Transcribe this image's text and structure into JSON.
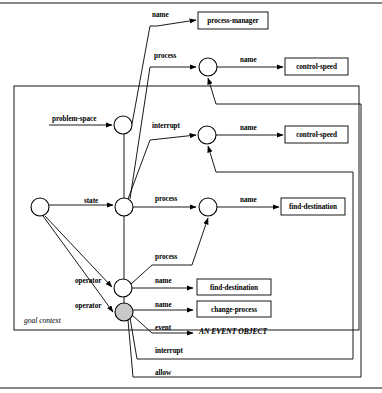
{
  "diagram": {
    "context_box": {
      "label": "goal context",
      "x": 14,
      "y": 86,
      "w": 345,
      "h": 244
    },
    "nodes": [
      {
        "id": "root",
        "name": "root-node",
        "cx": 40,
        "cy": 207,
        "r": 9,
        "shaded": false
      },
      {
        "id": "problem-space",
        "name": "problem-space-node",
        "cx": 123,
        "cy": 125,
        "r": 9,
        "shaded": false
      },
      {
        "id": "state",
        "name": "state-node",
        "cx": 124,
        "cy": 207,
        "r": 9,
        "shaded": false
      },
      {
        "id": "operator-1",
        "name": "operator-node-1",
        "cx": 123,
        "cy": 288,
        "r": 9,
        "shaded": false
      },
      {
        "id": "operator-2",
        "name": "operator-node-2",
        "cx": 124,
        "cy": 312,
        "r": 9,
        "shaded": true
      },
      {
        "id": "process-a",
        "name": "process-node-a",
        "cx": 208,
        "cy": 67,
        "r": 9,
        "shaded": false
      },
      {
        "id": "interrupt-a",
        "name": "interrupt-node-a",
        "cx": 207,
        "cy": 135,
        "r": 9,
        "shaded": false
      },
      {
        "id": "process-b",
        "name": "process-node-b",
        "cx": 208,
        "cy": 207,
        "r": 9,
        "shaded": false
      }
    ],
    "terminals": [
      {
        "id": "t-process-manager",
        "label": "process-manager",
        "x": 198,
        "y": 12,
        "w": 70,
        "h": 17
      },
      {
        "id": "t-control-speed-1",
        "label": "control-speed",
        "x": 285,
        "y": 58,
        "w": 63,
        "h": 17
      },
      {
        "id": "t-control-speed-2",
        "label": "control-speed",
        "x": 285,
        "y": 126,
        "w": 63,
        "h": 17
      },
      {
        "id": "t-find-destination-1",
        "label": "find-destination",
        "x": 281,
        "y": 198,
        "w": 64,
        "h": 17
      },
      {
        "id": "t-find-destination-2",
        "label": "find-destination",
        "x": 197,
        "y": 279,
        "w": 74,
        "h": 16
      },
      {
        "id": "t-change-process",
        "label": "change-process",
        "x": 197,
        "y": 301,
        "w": 74,
        "h": 16
      }
    ],
    "free_terminals": [
      {
        "id": "t-event-object",
        "label": "AN EVENT OBJECT",
        "x": 199,
        "y": 334
      }
    ],
    "edge_labels": [
      {
        "id": "lbl-name-1",
        "text": "name",
        "x": 152,
        "y": 17
      },
      {
        "id": "lbl-process-1",
        "text": "process",
        "x": 154,
        "y": 58
      },
      {
        "id": "lbl-name-2",
        "text": "name",
        "x": 240,
        "y": 62
      },
      {
        "id": "lbl-interrupt-1",
        "text": "interrupt",
        "x": 152,
        "y": 128
      },
      {
        "id": "lbl-name-3",
        "text": "name",
        "x": 240,
        "y": 130
      },
      {
        "id": "lbl-problem-space",
        "text": "problem-space",
        "x": 52,
        "y": 121
      },
      {
        "id": "lbl-state",
        "text": "state",
        "x": 84,
        "y": 203
      },
      {
        "id": "lbl-process-2",
        "text": "process",
        "x": 155,
        "y": 201
      },
      {
        "id": "lbl-name-4",
        "text": "name",
        "x": 240,
        "y": 202
      },
      {
        "id": "lbl-process-3",
        "text": "process",
        "x": 155,
        "y": 259
      },
      {
        "id": "lbl-operator-1",
        "text": "operator",
        "x": 75,
        "y": 283
      },
      {
        "id": "lbl-name-5",
        "text": "name",
        "x": 155,
        "y": 283
      },
      {
        "id": "lbl-operator-2",
        "text": "operator",
        "x": 75,
        "y": 308
      },
      {
        "id": "lbl-name-6",
        "text": "name",
        "x": 155,
        "y": 307
      },
      {
        "id": "lbl-event",
        "text": "event",
        "x": 155,
        "y": 330
      },
      {
        "id": "lbl-interrupt-2",
        "text": "interrupt",
        "x": 155,
        "y": 353
      },
      {
        "id": "lbl-allow",
        "text": "allow",
        "x": 155,
        "y": 375
      }
    ],
    "edges": [
      {
        "id": "e-name-1",
        "name": "edge-problem-space-to-process-manager",
        "d": "M 150 26 L 157 26 L 196 20",
        "arrow": true
      },
      {
        "id": "e-process-1",
        "name": "edge-to-process-node-a",
        "d": "M 150 67 L 196 67",
        "arrow": true
      },
      {
        "id": "e-name-2",
        "name": "edge-process-a-to-control-speed",
        "d": "M 217 67 L 283 67",
        "arrow": true
      },
      {
        "id": "e-interrupt-1",
        "name": "edge-to-interrupt-node-a",
        "d": "M 150 140 L 196 135",
        "arrow": true
      },
      {
        "id": "e-name-3",
        "name": "edge-interrupt-a-to-control-speed",
        "d": "M 216 135 L 283 135",
        "arrow": true
      },
      {
        "id": "e-problem-space",
        "name": "edge-root-to-problem-space",
        "d": "M 49 125 L 112 125",
        "arrow": true
      },
      {
        "id": "e-ps-riser",
        "name": "edge-problem-space-riser",
        "d": "M 132 124 L 150 26",
        "arrow": false
      },
      {
        "id": "e-state",
        "name": "edge-root-to-state",
        "d": "M 49 205 L 113 205",
        "arrow": true
      },
      {
        "id": "e-state-riser-1",
        "name": "edge-state-riser-process",
        "d": "M 130 199 L 150 67",
        "arrow": false
      },
      {
        "id": "e-state-riser-2",
        "name": "edge-state-riser-interrupt",
        "d": "M 128 199 L 150 140",
        "arrow": false
      },
      {
        "id": "e-process-2",
        "name": "edge-state-to-process-node-b",
        "d": "M 133 207 L 196 207",
        "arrow": true
      },
      {
        "id": "e-name-4",
        "name": "edge-process-b-to-find-destination",
        "d": "M 217 207 L 279 207",
        "arrow": true
      },
      {
        "id": "e-process-3",
        "name": "edge-operator-1-to-process-node-b",
        "d": "M 131 284 L 152 265 L 192 265 L 208 218",
        "arrow": true
      },
      {
        "id": "e-operator-1",
        "name": "edge-root-to-operator-1",
        "d": "M 45 216 L 112 287",
        "arrow": true
      },
      {
        "id": "e-operator-2",
        "name": "edge-root-to-operator-2",
        "d": "M 43 216 L 113 312",
        "arrow": true
      },
      {
        "id": "e-name-5",
        "name": "edge-operator-1-to-find-destination",
        "d": "M 132 288 L 193 288",
        "arrow": true
      },
      {
        "id": "e-name-6",
        "name": "edge-operator-2-to-change-process",
        "d": "M 133 310 L 193 310",
        "arrow": true
      },
      {
        "id": "e-event",
        "name": "edge-operator-2-to-event-object",
        "d": "M 132 315 L 152 333 L 193 333",
        "arrow": true
      },
      {
        "id": "e-op-riser",
        "name": "edge-operator-riser-to-state",
        "d": "M 124 303 L 124 128",
        "arrow": false
      },
      {
        "id": "e-interrupt-2",
        "name": "edge-operator-2-interrupt-feedback",
        "d": "M 130 318 L 137 359 L 353 359 L 353 172 L 216 172 L 208 146",
        "arrow": true
      },
      {
        "id": "e-allow",
        "name": "edge-operator-2-allow-feedback",
        "d": "M 128 320 L 133 377 L 361 377 L 361 104 L 216 104 L 208 78",
        "arrow": true
      }
    ],
    "colors": {
      "stroke": "#000000",
      "background": "#ffffff",
      "shaded_node_fill": "#c8c8c8"
    }
  }
}
